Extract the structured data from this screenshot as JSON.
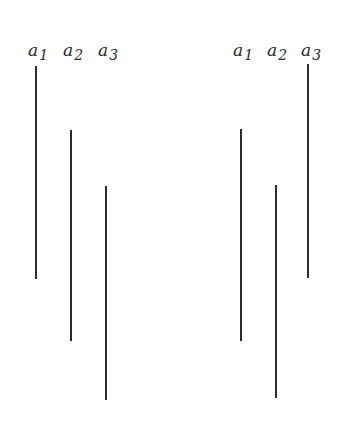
{
  "diagram": {
    "left_group": {
      "labels": [
        {
          "base": "a",
          "sub": "1"
        },
        {
          "base": "a",
          "sub": "2"
        },
        {
          "base": "a",
          "sub": "3"
        }
      ],
      "bars": [
        {
          "x": 36,
          "top": 66,
          "bottom": 279
        },
        {
          "x": 71,
          "top": 130,
          "bottom": 341
        },
        {
          "x": 106,
          "top": 186,
          "bottom": 400
        }
      ]
    },
    "right_group": {
      "labels": [
        {
          "base": "a",
          "sub": "1"
        },
        {
          "base": "a",
          "sub": "2"
        },
        {
          "base": "a",
          "sub": "3"
        }
      ],
      "bars": [
        {
          "x": 241,
          "top": 129,
          "bottom": 341
        },
        {
          "x": 276,
          "top": 185,
          "bottom": 398
        },
        {
          "x": 308,
          "top": 64,
          "bottom": 278
        }
      ]
    },
    "line_color": "#2b2b2b",
    "background": "#ffffff"
  }
}
